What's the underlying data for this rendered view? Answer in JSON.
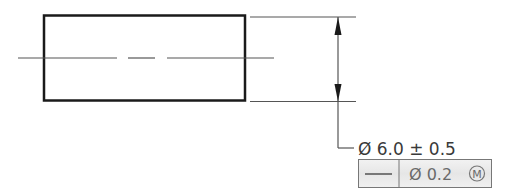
{
  "drawing": {
    "part": {
      "shape": "rectangle",
      "view": "side view of cylindrical pin"
    },
    "centerline": {
      "style": "dash-dot"
    },
    "dimension": {
      "symbol": "Ø",
      "value": "6.0",
      "tolerance_symbol": "±",
      "tolerance": "0.5",
      "text": "Ø 6.0 ± 0.5"
    },
    "feature_control_frame": {
      "characteristic_symbol": "straightness-icon",
      "tolerance_text": "Ø 0.2",
      "modifier": "M",
      "modifier_meaning": "maximum material condition"
    }
  },
  "colors": {
    "outline": "#1a1a1a",
    "thin_line": "#555555",
    "frame_fill": "#ededed",
    "frame_border": "#777777",
    "text": "#3a3a3a"
  }
}
